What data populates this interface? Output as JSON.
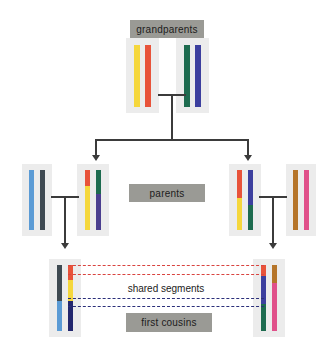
{
  "diagram": {
    "title_labels": {
      "grandparents": "grandparents",
      "parents": "parents",
      "first_cousins": "first cousins",
      "shared_segments": "shared segments"
    },
    "palette": {
      "box_bg": "#ececec",
      "chip_bg": "#9a9a95",
      "connector": "#3b3b3b",
      "dash_red": "#d9433f",
      "dash_blue": "#2b2f7a",
      "yellow": "#f5d73c",
      "red": "#e8533a",
      "green": "#1d6b4f",
      "blue_violet": "#3c3f9e",
      "light_blue": "#5b9bd5",
      "charcoal": "#3f4a52",
      "purple": "#4b3f8f",
      "brown": "#b5752a",
      "pink": "#e0508a",
      "dark_green": "#1d6b4f",
      "navy": "#23276e"
    },
    "generations": [
      {
        "name": "grandparents",
        "people": [
          {
            "id": "grandparent-1",
            "chromosomes": [
              {
                "segments": [
                  {
                    "color": "#f5d73c",
                    "fraction": 1.0
                  }
                ]
              },
              {
                "segments": [
                  {
                    "color": "#e8533a",
                    "fraction": 1.0
                  }
                ]
              }
            ]
          },
          {
            "id": "grandparent-2",
            "chromosomes": [
              {
                "segments": [
                  {
                    "color": "#1d6b4f",
                    "fraction": 1.0
                  }
                ]
              },
              {
                "segments": [
                  {
                    "color": "#3c3f9e",
                    "fraction": 1.0
                  }
                ]
              }
            ]
          }
        ]
      },
      {
        "name": "parents",
        "people": [
          {
            "id": "parent-spouse-left",
            "chromosomes": [
              {
                "segments": [
                  {
                    "color": "#5b9bd5",
                    "fraction": 1.0
                  }
                ]
              },
              {
                "segments": [
                  {
                    "color": "#3f4a52",
                    "fraction": 1.0
                  }
                ]
              }
            ]
          },
          {
            "id": "parent-child-left",
            "chromosomes": [
              {
                "segments": [
                  {
                    "color": "#e8533a",
                    "fraction": 0.26
                  },
                  {
                    "color": "#f5d73c",
                    "fraction": 0.74
                  }
                ]
              },
              {
                "segments": [
                  {
                    "color": "#1d6b4f",
                    "fraction": 0.4
                  },
                  {
                    "color": "#4b3f8f",
                    "fraction": 0.6
                  }
                ]
              }
            ]
          },
          {
            "id": "parent-child-right",
            "chromosomes": [
              {
                "segments": [
                  {
                    "color": "#e8533a",
                    "fraction": 0.46
                  },
                  {
                    "color": "#f5d73c",
                    "fraction": 0.54
                  }
                ]
              },
              {
                "segments": [
                  {
                    "color": "#3c3f9e",
                    "fraction": 0.58
                  },
                  {
                    "color": "#1d6b4f",
                    "fraction": 0.42
                  }
                ]
              }
            ]
          },
          {
            "id": "parent-spouse-right",
            "chromosomes": [
              {
                "segments": [
                  {
                    "color": "#b5752a",
                    "fraction": 1.0
                  }
                ]
              },
              {
                "segments": [
                  {
                    "color": "#e0508a",
                    "fraction": 1.0
                  }
                ]
              }
            ]
          }
        ]
      },
      {
        "name": "first cousins",
        "people": [
          {
            "id": "cousin-left",
            "chromosomes": [
              {
                "segments": [
                  {
                    "color": "#3f4a52",
                    "fraction": 0.55
                  },
                  {
                    "color": "#5b9bd5",
                    "fraction": 0.45
                  }
                ]
              },
              {
                "segments": [
                  {
                    "color": "#e8533a",
                    "fraction": 0.22
                  },
                  {
                    "color": "#f5d73c",
                    "fraction": 0.33
                  },
                  {
                    "color": "#23276e",
                    "fraction": 0.45
                  }
                ]
              }
            ]
          },
          {
            "id": "cousin-right",
            "chromosomes": [
              {
                "segments": [
                  {
                    "color": "#e8533a",
                    "fraction": 0.17
                  },
                  {
                    "color": "#3c3f9e",
                    "fraction": 0.42
                  },
                  {
                    "color": "#1d6b4f",
                    "fraction": 0.41
                  }
                ]
              },
              {
                "segments": [
                  {
                    "color": "#b5752a",
                    "fraction": 0.28
                  },
                  {
                    "color": "#e0508a",
                    "fraction": 0.72
                  }
                ]
              }
            ]
          }
        ]
      }
    ],
    "shared_segment_links": [
      {
        "id": "shared-red-top",
        "color": "#d9433f",
        "y": 266
      },
      {
        "id": "shared-red-bottom",
        "color": "#d9433f",
        "y": 275
      },
      {
        "id": "shared-blue-top",
        "color": "#2b2f7a",
        "y": 299
      },
      {
        "id": "shared-blue-bottom",
        "color": "#2b2f7a",
        "y": 307
      }
    ]
  }
}
